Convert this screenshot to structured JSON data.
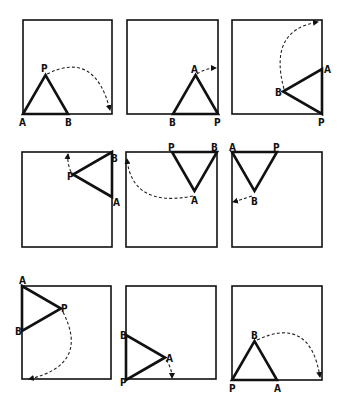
{
  "figure": {
    "panels": [
      {
        "id": 1,
        "square": [
          23,
          20,
          112,
          114
        ],
        "A": [
          23,
          114
        ],
        "B": [
          68,
          114
        ],
        "P": [
          45.5,
          75
        ],
        "labels": {
          "A": "A",
          "B": "B",
          "P": "P"
        },
        "label_pos": {
          "A": [
            19,
            126
          ],
          "B": [
            65,
            126
          ],
          "P": [
            41,
            72
          ]
        },
        "arc": "M47 74 Q 95 50 110 110"
      },
      {
        "id": 2,
        "square": [
          127,
          20,
          218,
          114
        ],
        "A": [
          195.5,
          75
        ],
        "B": [
          173,
          114
        ],
        "P": [
          218,
          114
        ],
        "labels": {
          "A": "A",
          "B": "B",
          "P": "P"
        },
        "label_pos": {
          "A": [
            191,
            73
          ],
          "B": [
            169,
            126
          ],
          "P": [
            214,
            126
          ]
        },
        "arc": "M197 74 Q 206 68 216 68"
      },
      {
        "id": 3,
        "square": [
          232,
          20,
          322,
          114
        ],
        "A": [
          322,
          69
        ],
        "B": [
          283,
          91.5
        ],
        "P": [
          322,
          114
        ],
        "labels": {
          "A": "A",
          "B": "B",
          "P": "P"
        },
        "label_pos": {
          "A": [
            324,
            73
          ],
          "B": [
            275,
            96
          ],
          "P": [
            318,
            126
          ]
        },
        "arc": "M284 89 Q 268 30 318 22"
      },
      {
        "id": 4,
        "square": [
          22,
          152,
          112,
          247
        ],
        "A": [
          112,
          197
        ],
        "B": [
          112,
          152
        ],
        "P": [
          73,
          174.5
        ],
        "labels": {
          "A": "A",
          "B": "B",
          "P": "P"
        },
        "label_pos": {
          "A": [
            113,
            206
          ],
          "B": [
            111,
            162
          ],
          "P": [
            67,
            180
          ]
        },
        "arc": "M71 172 Q 67 163 68 154"
      },
      {
        "id": 5,
        "square": [
          126,
          152,
          217,
          247
        ],
        "A": [
          194.5,
          191
        ],
        "B": [
          217,
          152
        ],
        "P": [
          172,
          152
        ],
        "labels": {
          "A": "A",
          "B": "B",
          "P": "P"
        },
        "label_pos": {
          "A": [
            191,
            204
          ],
          "B": [
            211,
            151
          ],
          "P": [
            168,
            151
          ]
        },
        "arc": "M193 196 Q 132 208 127 159"
      },
      {
        "id": 6,
        "square": [
          232,
          152,
          322,
          247
        ],
        "A": [
          232,
          152
        ],
        "B": [
          254.5,
          191
        ],
        "P": [
          277,
          152
        ],
        "labels": {
          "A": "A",
          "B": "B",
          "P": "P"
        },
        "label_pos": {
          "A": [
            229,
            151
          ],
          "B": [
            251,
            205
          ],
          "P": [
            273,
            151
          ]
        },
        "arc": "M252 196 Q 240 200 233 202"
      },
      {
        "id": 7,
        "square": [
          22,
          286,
          111,
          379
        ],
        "A": [
          22,
          286
        ],
        "B": [
          22,
          331
        ],
        "P": [
          61,
          308.5
        ],
        "labels": {
          "A": "A",
          "B": "B",
          "P": "P"
        },
        "label_pos": {
          "A": [
            19,
            284
          ],
          "B": [
            15,
            335
          ],
          "P": [
            61,
            312
          ]
        },
        "arc": "M63 312 Q 90 365 29 379"
      },
      {
        "id": 8,
        "square": [
          126,
          286,
          216,
          379
        ],
        "A": [
          165,
          357.5
        ],
        "B": [
          126,
          335
        ],
        "P": [
          126,
          380
        ],
        "labels": {
          "A": "A",
          "B": "B",
          "P": "P"
        },
        "label_pos": {
          "A": [
            166,
            362
          ],
          "B": [
            120,
            339
          ],
          "P": [
            120,
            386
          ]
        },
        "arc": "M166 360 Q 172 368 172 378"
      },
      {
        "id": 9,
        "square": [
          232,
          286,
          322,
          380
        ],
        "A": [
          277,
          380
        ],
        "B": [
          254.5,
          341
        ],
        "P": [
          232,
          380
        ],
        "labels": {
          "A": "A",
          "B": "B",
          "P": "P"
        },
        "label_pos": {
          "A": [
            274,
            392
          ],
          "B": [
            251,
            339
          ],
          "P": [
            229,
            392
          ]
        },
        "arc": "M257 340 Q 310 315 320 377"
      }
    ]
  },
  "colors": {
    "ink": "#111111",
    "background": "#ffffff"
  }
}
